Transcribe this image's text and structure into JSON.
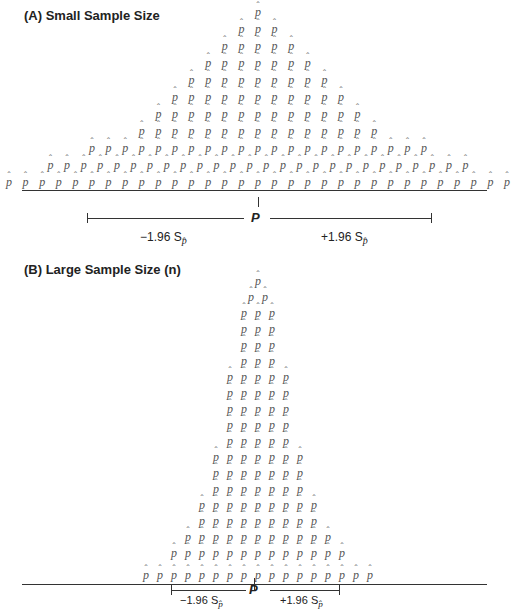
{
  "panels": [
    {
      "title": "(A) Small Sample Size",
      "symbol": "p̂",
      "center_x": 258,
      "spacing": 16.6,
      "rows": [
        {
          "y": 12,
          "count": 1
        },
        {
          "y": 29,
          "count": 3
        },
        {
          "y": 46,
          "count": 5
        },
        {
          "y": 63,
          "count": 7
        },
        {
          "y": 80,
          "count": 9
        },
        {
          "y": 97,
          "count": 11
        },
        {
          "y": 114,
          "count": 13
        },
        {
          "y": 131,
          "count": 15
        },
        {
          "y": 148,
          "count": 21
        },
        {
          "y": 165,
          "count": 26
        },
        {
          "y": 182,
          "count": 31
        }
      ],
      "axis_y": 190,
      "ci": {
        "left_x": 87,
        "right_x": 431,
        "y": 218,
        "center_label": "P",
        "left_label": "−1.96 S",
        "right_label": "+1.96 S",
        "sub": "p̂"
      }
    },
    {
      "title": "(B) Large Sample Size (n)",
      "symbol": "p̂",
      "center_x": 258,
      "spacing": 14,
      "rows": [
        {
          "y": 281,
          "count": 1
        },
        {
          "y": 297,
          "count": 2
        },
        {
          "y": 313,
          "count": 3
        },
        {
          "y": 329,
          "count": 3
        },
        {
          "y": 345,
          "count": 3
        },
        {
          "y": 361,
          "count": 3
        },
        {
          "y": 377,
          "count": 5
        },
        {
          "y": 393,
          "count": 5
        },
        {
          "y": 409,
          "count": 5
        },
        {
          "y": 425,
          "count": 5
        },
        {
          "y": 441,
          "count": 5
        },
        {
          "y": 457,
          "count": 7
        },
        {
          "y": 473,
          "count": 7
        },
        {
          "y": 489,
          "count": 7
        },
        {
          "y": 505,
          "count": 9
        },
        {
          "y": 521,
          "count": 9
        },
        {
          "y": 537,
          "count": 11
        },
        {
          "y": 553,
          "count": 13
        },
        {
          "y": 575,
          "count": 17
        }
      ],
      "axis_y": 583,
      "ci": {
        "left_x": 171,
        "right_x": 339,
        "y": 579,
        "center_label": "P",
        "left_label": "−1.96 S",
        "right_label": "+1.96 S",
        "sub": "p̂"
      }
    }
  ],
  "caption": "Effect of sample size on the width of the confidence interval"
}
